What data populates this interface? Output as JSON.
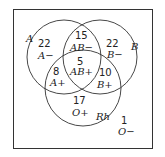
{
  "diagram": {
    "type": "venn",
    "sets": [
      {
        "name": "A"
      },
      {
        "name": "B"
      },
      {
        "name": "Rh"
      }
    ],
    "regions": [
      {
        "id": "a_minus",
        "count": "22",
        "label": "A−"
      },
      {
        "id": "ab_minus",
        "count": "15",
        "label": "AB−"
      },
      {
        "id": "b_minus",
        "count": "22",
        "label": "B−"
      },
      {
        "id": "ab_plus",
        "count": "5",
        "label": "AB+"
      },
      {
        "id": "a_plus",
        "count": "8",
        "label": "A+"
      },
      {
        "id": "b_plus",
        "count": "10",
        "label": "B+"
      },
      {
        "id": "o_plus",
        "count": "17",
        "label": "O+"
      },
      {
        "id": "o_minus",
        "count": "1",
        "label": "O−"
      }
    ],
    "colors": {
      "stroke": "#333333",
      "background": "#ffffff"
    }
  }
}
